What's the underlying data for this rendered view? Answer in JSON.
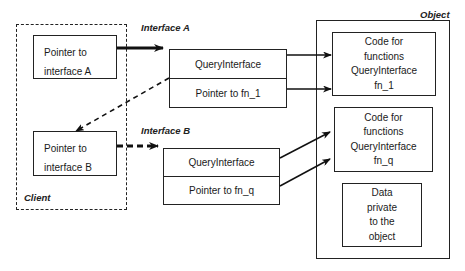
{
  "client": {
    "label": "Client",
    "pointer_a": {
      "line1": "Pointer to",
      "line2": "interface A"
    },
    "pointer_b": {
      "line1": "Pointer to",
      "line2": "interface B"
    }
  },
  "interface_a": {
    "label": "Interface A",
    "rows": [
      "QueryInterface",
      "Pointer to fn_1"
    ]
  },
  "interface_b": {
    "label": "Interface B",
    "rows": [
      "QueryInterface",
      "Pointer to fn_q"
    ]
  },
  "object": {
    "label": "Object",
    "code_box_1": [
      "Code for",
      "functions",
      "QueryInterface",
      "fn_1"
    ],
    "code_box_2": [
      "Code for",
      "functions",
      "QueryInterface",
      "fn_q"
    ],
    "data_box": [
      "Data",
      "private",
      "to the",
      "object"
    ]
  }
}
